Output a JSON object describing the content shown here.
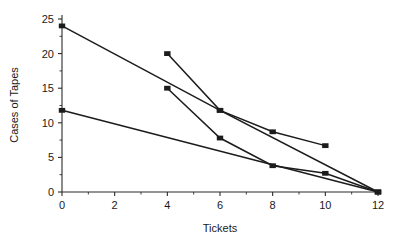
{
  "chart_data": {
    "type": "line",
    "title": "",
    "xlabel": "Tickets",
    "ylabel": "Cases of Tapes",
    "xlim": [
      0,
      12
    ],
    "ylim": [
      0,
      25
    ],
    "xticks": [
      0,
      2,
      4,
      6,
      8,
      10,
      12
    ],
    "xtick_labels": [
      "0",
      "2",
      "4",
      "6",
      "8",
      "10",
      "12"
    ],
    "xticks_minor": [
      1,
      3,
      5,
      7,
      9,
      11
    ],
    "yticks": [
      0,
      5,
      10,
      15,
      20,
      25
    ],
    "ytick_labels": [
      "0",
      "5",
      "10",
      "15",
      "20",
      "25"
    ],
    "yticks_minor": [
      2.5,
      7.5,
      12.5,
      17.5,
      22.5
    ],
    "grid": false,
    "legend": "none",
    "marker": "square",
    "marker_color": "#1c1c1c",
    "line_color": "#1c1c1c",
    "series": [
      {
        "name": "Series 1",
        "points": [
          [
            0,
            24.0
          ],
          [
            6,
            11.8
          ],
          [
            8,
            8.7
          ],
          [
            10,
            6.7
          ]
        ]
      },
      {
        "name": "Series 2",
        "points": [
          [
            0,
            11.8
          ],
          [
            12,
            0
          ]
        ]
      },
      {
        "name": "Series 3",
        "points": [
          [
            4,
            20.0
          ],
          [
            6,
            11.8
          ],
          [
            12,
            0
          ]
        ]
      },
      {
        "name": "Series 4",
        "points": [
          [
            4,
            15.0
          ],
          [
            6,
            7.8
          ],
          [
            8,
            3.8
          ],
          [
            10,
            2.7
          ],
          [
            12,
            0
          ]
        ]
      }
    ]
  },
  "axes": {
    "x_title": "Tickets",
    "y_title": "Cases of Tapes"
  }
}
